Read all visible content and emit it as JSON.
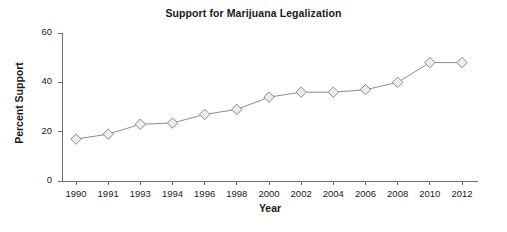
{
  "chart_data": {
    "type": "line",
    "title": "Support for Marijuana Legalization",
    "xlabel": "Year",
    "ylabel": "Percent Support",
    "categories": [
      "1990",
      "1991",
      "1993",
      "1994",
      "1996",
      "1998",
      "2000",
      "2002",
      "2004",
      "2006",
      "2008",
      "2010",
      "2012"
    ],
    "x": [
      1990,
      1991,
      1993,
      1994,
      1996,
      1998,
      2000,
      2002,
      2004,
      2006,
      2008,
      2010,
      2012
    ],
    "values": [
      17,
      19,
      23,
      23.5,
      27,
      29,
      34,
      36,
      36,
      37,
      40,
      48,
      48
    ],
    "series": [
      {
        "name": "Percent Support",
        "values": [
          17,
          19,
          23,
          23.5,
          27,
          29,
          34,
          36,
          36,
          37,
          40,
          48,
          48
        ]
      }
    ],
    "ylim": [
      0,
      60
    ],
    "y_ticks": [
      0,
      20,
      40,
      60
    ],
    "y_tick_labels": [
      "0",
      "20",
      "40",
      "60"
    ],
    "x_tick_labels": [
      "1990",
      "1991",
      "1993",
      "1994",
      "1996",
      "1998",
      "2000",
      "2002",
      "2004",
      "2006",
      "2008",
      "2010",
      "2012"
    ],
    "grid": false,
    "legend": false,
    "legend_position": "none",
    "marker": "diamond",
    "marker_fill_color": "#ececec",
    "marker_edge_color": "#8c8c8c",
    "line_color": "#8c8c8c",
    "axis_color": "#6e6e6e",
    "background_color": "#ffffff",
    "text_color": "#1a1a1a"
  }
}
